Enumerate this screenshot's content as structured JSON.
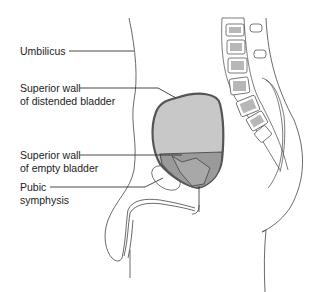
{
  "diagram": {
    "title": "",
    "type": "anatomical-sagittal-section",
    "labels": [
      {
        "id": "umbilicus",
        "line1": "Umbilicus",
        "line2": ""
      },
      {
        "id": "superior-wall-distended",
        "line1": "Superior wall",
        "line2": "of distended bladder"
      },
      {
        "id": "superior-wall-empty",
        "line1": "Superior wall",
        "line2": "of empty bladder"
      },
      {
        "id": "pubic-symphysis",
        "line1": "Pubic",
        "line2": "symphysis"
      }
    ],
    "colors": {
      "distended_bladder_fill": "#c8c8c8",
      "empty_bladder_fill": "#9a9a9a",
      "outline": "#555555",
      "line": "#333333"
    }
  }
}
